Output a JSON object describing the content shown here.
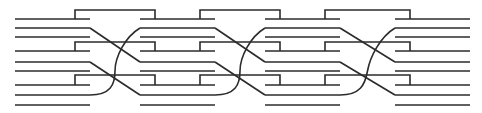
{
  "diagram": {
    "columns": 4,
    "lines_per_column": 9,
    "brackets_per_gap": 3,
    "crossings_per_gap": 2,
    "line_color": "#2b2b2b",
    "background": "#ffffff"
  }
}
